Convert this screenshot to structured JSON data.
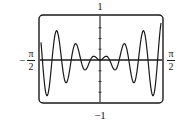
{
  "chart_data": {
    "type": "line",
    "title": "",
    "xlabel": "",
    "ylabel": "",
    "function_hint": "y ≈ 0.6·x·sin(12.5x)",
    "xlim": [
      "-π/2",
      "π/2"
    ],
    "ylim": [
      -1,
      1
    ],
    "grid": false,
    "legend": null,
    "tick_labels": {
      "y_top": "1",
      "y_bottom": "−1",
      "x_left_sign": "−",
      "x_left_num": "π",
      "x_left_den": "2",
      "x_right_num": "π",
      "x_right_den": "2"
    },
    "x": [
      -1.571,
      -1.445,
      -1.32,
      -1.194,
      -1.068,
      -0.942,
      -0.817,
      -0.691,
      -0.565,
      -0.44,
      -0.314,
      -0.188,
      -0.063,
      0,
      0.063,
      0.188,
      0.314,
      0.44,
      0.565,
      0.691,
      0.817,
      0.942,
      1.068,
      1.194,
      1.32,
      1.445,
      1.571
    ],
    "peaks_troughs": [
      {
        "x": -1.43,
        "y": -0.95
      },
      {
        "x": -1.18,
        "y": 0.88
      },
      {
        "x": -0.93,
        "y": -0.75
      },
      {
        "x": -0.68,
        "y": 0.55
      },
      {
        "x": -0.43,
        "y": -0.35
      },
      {
        "x": -0.15,
        "y": 0.1
      },
      {
        "x": 0,
        "y": 0
      },
      {
        "x": 0.15,
        "y": 0.1
      },
      {
        "x": 0.43,
        "y": -0.35
      },
      {
        "x": 0.68,
        "y": 0.55
      },
      {
        "x": 0.93,
        "y": -0.75
      },
      {
        "x": 1.18,
        "y": 0.88
      },
      {
        "x": 1.43,
        "y": -0.95
      }
    ],
    "amplitude": 0.6,
    "frequency": 12.5
  },
  "colors": {
    "ink": "#1a1a1a",
    "background": "#ffffff"
  }
}
